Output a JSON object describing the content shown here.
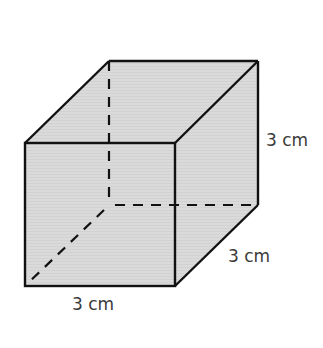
{
  "diagram": {
    "type": "cube",
    "fill_color": "#d9d9d9",
    "stroke_color": "#111111",
    "vertices": {
      "front_top_left": [
        25,
        143
      ],
      "front_top_right": [
        175,
        143
      ],
      "front_bottom_right": [
        175,
        286
      ],
      "front_bottom_left": [
        25,
        286
      ],
      "back_top_left": [
        109,
        61
      ],
      "back_top_right": [
        258,
        61
      ],
      "back_bottom_right": [
        258,
        205
      ],
      "back_bottom_left": [
        109,
        205
      ]
    },
    "labels": {
      "height": "3 cm",
      "depth": "3 cm",
      "width": "3 cm"
    }
  }
}
